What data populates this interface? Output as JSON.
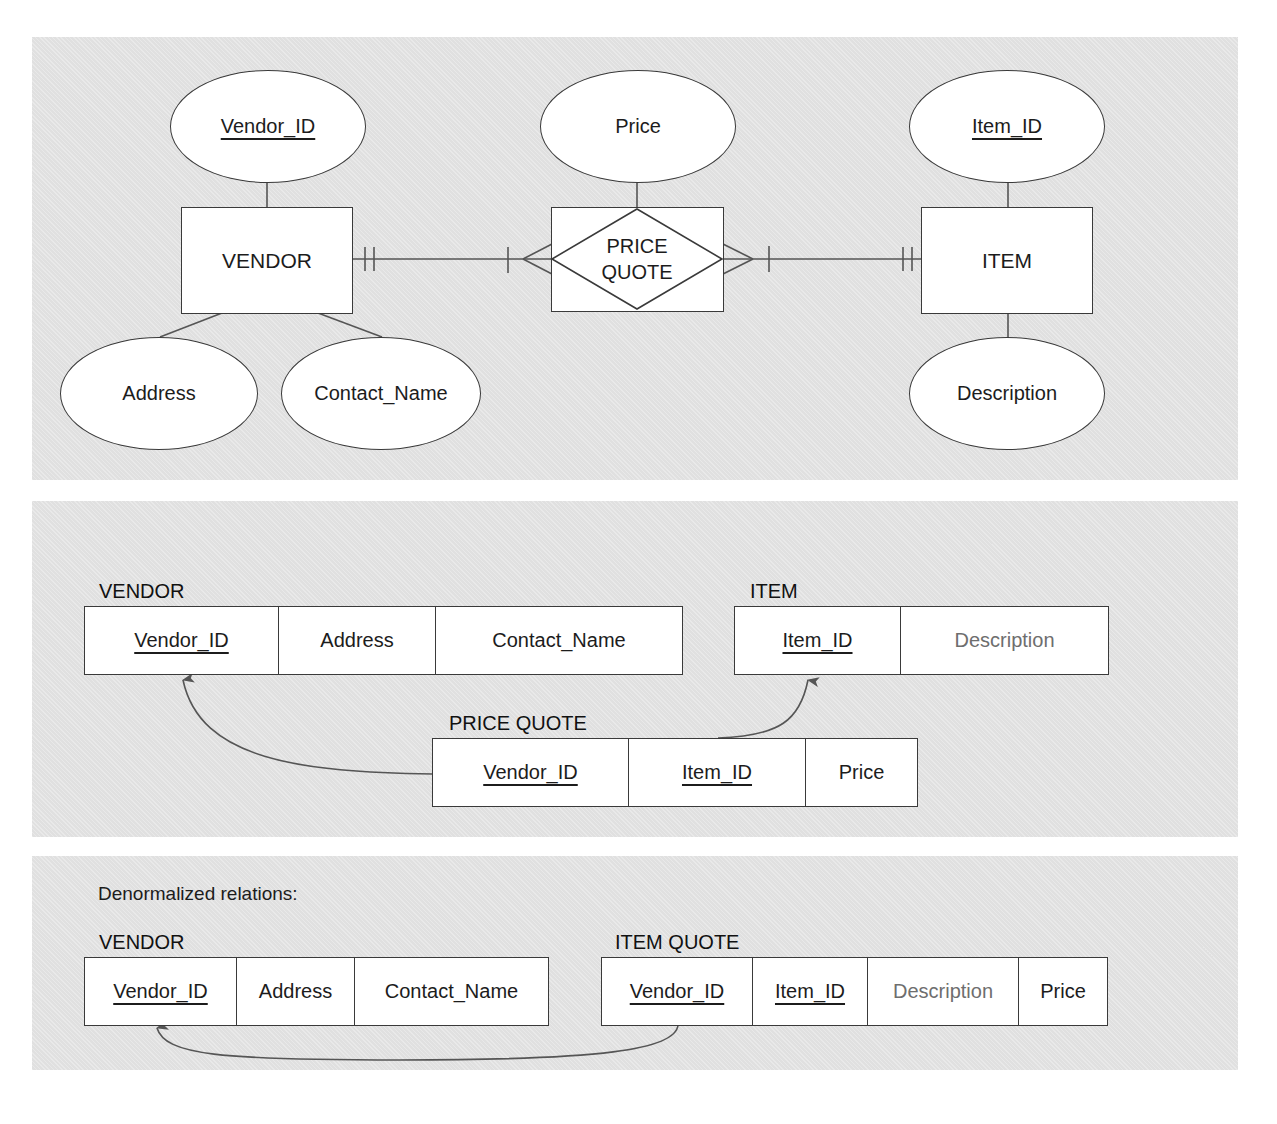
{
  "er_diagram": {
    "entities": {
      "vendor": {
        "label": "VENDOR"
      },
      "item": {
        "label": "ITEM"
      }
    },
    "associative_entity": {
      "line1": "PRICE",
      "line2": "QUOTE"
    },
    "attributes": {
      "vendor_id": {
        "label": "Vendor_ID",
        "primary_key": true
      },
      "address": {
        "label": "Address",
        "primary_key": false
      },
      "contact_name": {
        "label": "Contact_Name",
        "primary_key": false
      },
      "price": {
        "label": "Price",
        "primary_key": false
      },
      "item_id": {
        "label": "Item_ID",
        "primary_key": true
      },
      "description": {
        "label": "Description",
        "primary_key": false
      }
    },
    "relationships": [
      {
        "from": "VENDOR",
        "to": "PRICE QUOTE",
        "from_cardinality": "mandatory one",
        "to_cardinality": "mandatory many"
      },
      {
        "from": "ITEM",
        "to": "PRICE QUOTE",
        "from_cardinality": "mandatory one",
        "to_cardinality": "mandatory many"
      }
    ]
  },
  "normalized": {
    "heading": "Normalized relations:",
    "vendor": {
      "title": "VENDOR",
      "columns": [
        "Vendor_ID",
        "Address",
        "Contact_Name"
      ]
    },
    "item": {
      "title": "ITEM",
      "columns": [
        "Item_ID",
        "Description"
      ]
    },
    "price_quote": {
      "title": "PRICE QUOTE",
      "columns": [
        "Vendor_ID",
        "Item_ID",
        "Price"
      ]
    }
  },
  "denormalized": {
    "heading": "Denormalized relations:",
    "vendor": {
      "title": "VENDOR",
      "columns": [
        "Vendor_ID",
        "Address",
        "Contact_Name"
      ]
    },
    "item_quote": {
      "title": "ITEM QUOTE",
      "columns": [
        "Vendor_ID",
        "Item_ID",
        "Description",
        "Price"
      ]
    }
  },
  "colors": {
    "panel_background": "#e4e4e4",
    "line": "#3a3a3a",
    "arrow": "#555555",
    "muted_text": "#6e6e6e"
  }
}
